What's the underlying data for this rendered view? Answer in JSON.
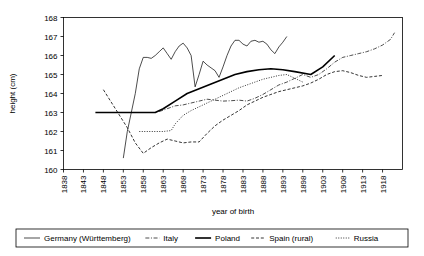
{
  "chart_data": {
    "type": "line",
    "title": "",
    "xlabel": "year of birth",
    "ylabel": "height (cm)",
    "xlim": [
      1838,
      1923
    ],
    "ylim": [
      160,
      168
    ],
    "xticks": [
      1838,
      1843,
      1848,
      1853,
      1858,
      1863,
      1868,
      1873,
      1878,
      1883,
      1888,
      1893,
      1898,
      1903,
      1908,
      1913,
      1918
    ],
    "yticks": [
      160,
      161,
      162,
      163,
      164,
      165,
      166,
      167,
      168
    ],
    "grid": false,
    "legend_position": "bottom",
    "series": [
      {
        "name": "Germany (Württemberg)",
        "style": "solid-thin",
        "stroke_width": 0.7,
        "dash": "none",
        "points": [
          [
            1853,
            160.6
          ],
          [
            1854,
            162.0
          ],
          [
            1855,
            163.0
          ],
          [
            1856,
            164.0
          ],
          [
            1857,
            165.3
          ],
          [
            1858,
            165.9
          ],
          [
            1859,
            165.9
          ],
          [
            1860,
            165.85
          ],
          [
            1861,
            166.0
          ],
          [
            1862,
            166.2
          ],
          [
            1863,
            166.4
          ],
          [
            1864,
            166.1
          ],
          [
            1865,
            165.8
          ],
          [
            1866,
            166.2
          ],
          [
            1867,
            166.5
          ],
          [
            1868,
            166.65
          ],
          [
            1869,
            166.4
          ],
          [
            1870,
            166.0
          ],
          [
            1871,
            164.35
          ],
          [
            1872,
            165.0
          ],
          [
            1873,
            165.7
          ],
          [
            1874,
            165.5
          ],
          [
            1875,
            165.35
          ],
          [
            1876,
            165.2
          ],
          [
            1877,
            164.85
          ],
          [
            1878,
            165.4
          ],
          [
            1879,
            166.0
          ],
          [
            1880,
            166.5
          ],
          [
            1881,
            166.8
          ],
          [
            1882,
            166.8
          ],
          [
            1883,
            166.6
          ],
          [
            1884,
            166.5
          ],
          [
            1885,
            166.75
          ],
          [
            1886,
            166.8
          ],
          [
            1887,
            166.7
          ],
          [
            1888,
            166.75
          ],
          [
            1889,
            166.6
          ],
          [
            1890,
            166.3
          ],
          [
            1891,
            166.1
          ],
          [
            1892,
            166.45
          ],
          [
            1893,
            166.7
          ],
          [
            1894,
            167.0
          ]
        ]
      },
      {
        "name": "Italy",
        "style": "dash-dot",
        "stroke_width": 0.7,
        "dash": "4,1.6,1,1.6",
        "points": [
          [
            1862,
            163.05
          ],
          [
            1864,
            163.2
          ],
          [
            1866,
            163.35
          ],
          [
            1868,
            163.4
          ],
          [
            1870,
            163.5
          ],
          [
            1872,
            163.6
          ],
          [
            1874,
            163.7
          ],
          [
            1876,
            163.65
          ],
          [
            1878,
            163.6
          ],
          [
            1880,
            163.62
          ],
          [
            1882,
            163.65
          ],
          [
            1884,
            163.6
          ],
          [
            1886,
            163.75
          ],
          [
            1888,
            163.95
          ],
          [
            1890,
            164.2
          ],
          [
            1892,
            164.45
          ],
          [
            1894,
            164.6
          ],
          [
            1896,
            164.8
          ],
          [
            1898,
            165.0
          ],
          [
            1900,
            164.85
          ],
          [
            1902,
            165.0
          ],
          [
            1904,
            165.3
          ],
          [
            1906,
            165.65
          ],
          [
            1908,
            165.9
          ],
          [
            1910,
            166.0
          ],
          [
            1912,
            166.1
          ],
          [
            1914,
            166.2
          ],
          [
            1916,
            166.35
          ],
          [
            1918,
            166.55
          ],
          [
            1920,
            166.85
          ],
          [
            1921,
            167.2
          ]
        ]
      },
      {
        "name": "Poland",
        "style": "solid-thick",
        "stroke_width": 1.6,
        "dash": "none",
        "points": [
          [
            1846,
            163.0
          ],
          [
            1861,
            163.0
          ],
          [
            1863,
            163.2
          ],
          [
            1866,
            163.6
          ],
          [
            1869,
            164.0
          ],
          [
            1872,
            164.25
          ],
          [
            1875,
            164.5
          ],
          [
            1878,
            164.75
          ],
          [
            1881,
            165.0
          ],
          [
            1884,
            165.15
          ],
          [
            1887,
            165.25
          ],
          [
            1890,
            165.3
          ],
          [
            1893,
            165.25
          ],
          [
            1896,
            165.15
          ],
          [
            1900,
            165.0
          ],
          [
            1903,
            165.4
          ],
          [
            1906,
            166.0
          ]
        ]
      },
      {
        "name": "Spain (rural)",
        "style": "dashed",
        "stroke_width": 0.8,
        "dash": "3,1.8",
        "points": [
          [
            1848,
            164.2
          ],
          [
            1851,
            163.2
          ],
          [
            1854,
            162.2
          ],
          [
            1856,
            161.4
          ],
          [
            1858,
            160.85
          ],
          [
            1860,
            161.15
          ],
          [
            1862,
            161.4
          ],
          [
            1864,
            161.6
          ],
          [
            1866,
            161.5
          ],
          [
            1868,
            161.4
          ],
          [
            1870,
            161.45
          ],
          [
            1872,
            161.45
          ],
          [
            1874,
            161.9
          ],
          [
            1876,
            162.3
          ],
          [
            1878,
            162.6
          ],
          [
            1880,
            162.85
          ],
          [
            1882,
            163.1
          ],
          [
            1884,
            163.4
          ],
          [
            1886,
            163.6
          ],
          [
            1888,
            163.8
          ],
          [
            1890,
            163.95
          ],
          [
            1892,
            164.1
          ],
          [
            1894,
            164.2
          ],
          [
            1896,
            164.3
          ],
          [
            1898,
            164.4
          ],
          [
            1900,
            164.55
          ],
          [
            1902,
            164.75
          ],
          [
            1904,
            165.0
          ],
          [
            1906,
            165.15
          ],
          [
            1908,
            165.2
          ],
          [
            1910,
            165.1
          ],
          [
            1912,
            164.95
          ],
          [
            1914,
            164.85
          ],
          [
            1916,
            164.9
          ],
          [
            1918,
            164.95
          ]
        ]
      },
      {
        "name": "Russia",
        "style": "dotted",
        "stroke_width": 0.8,
        "dash": "1,1.5",
        "points": [
          [
            1857,
            162.0
          ],
          [
            1860,
            162.0
          ],
          [
            1863,
            162.0
          ],
          [
            1865,
            162.05
          ],
          [
            1866,
            162.4
          ],
          [
            1868,
            162.85
          ],
          [
            1870,
            163.1
          ],
          [
            1872,
            163.3
          ],
          [
            1874,
            163.5
          ],
          [
            1876,
            163.7
          ],
          [
            1878,
            163.9
          ],
          [
            1880,
            164.1
          ],
          [
            1882,
            164.3
          ],
          [
            1884,
            164.45
          ],
          [
            1886,
            164.6
          ],
          [
            1888,
            164.75
          ],
          [
            1890,
            164.85
          ],
          [
            1892,
            164.95
          ],
          [
            1894,
            165.0
          ],
          [
            1896,
            164.8
          ],
          [
            1898,
            164.6
          ]
        ]
      }
    ]
  },
  "legend": {
    "items": [
      {
        "label": "Germany (Württemberg)"
      },
      {
        "label": "Italy"
      },
      {
        "label": "Poland"
      },
      {
        "label": "Spain (rural)"
      },
      {
        "label": "Russia"
      }
    ]
  }
}
